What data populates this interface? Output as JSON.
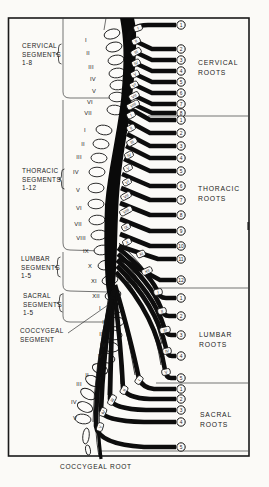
{
  "figure": {
    "left_column": {
      "cervical_segments": [
        "CERVICAL",
        "SEGMENTS",
        "1-8"
      ],
      "thoracic_segments": [
        "THORACIC",
        "SEGMENTS",
        "1-12"
      ],
      "lumbar_segments": [
        "LUMBAR",
        "SEGMENTS",
        "1-5"
      ],
      "sacral_segments": [
        "SACRAL",
        "SEGMENTS",
        "1-5"
      ],
      "coccygeal_segment": [
        "COCCYGEAL",
        "SEGMENT"
      ]
    },
    "right_column": {
      "cervical_roots": [
        "CERVICAL",
        "ROOTS"
      ],
      "thoracic_roots": [
        "THORACIC",
        "ROOTS"
      ],
      "lumbar_roots": [
        "LUMBAR",
        "ROOTS"
      ],
      "sacral_roots": [
        "SACRAL",
        "ROOTS"
      ]
    },
    "bottom_label": "COCCYGEAL ROOT",
    "vertebra_numerals": {
      "cervical": [
        "I",
        "II",
        "III",
        "IV",
        "V",
        "VI",
        "VII"
      ],
      "thoracic": [
        "I",
        "II",
        "III",
        "IV",
        "V",
        "VI",
        "VII",
        "VIII",
        "IX",
        "X",
        "XI",
        "XII"
      ],
      "lumbar": [
        "I",
        "II",
        "III",
        "IV",
        "V"
      ],
      "sacral": [
        "I",
        "II",
        "III",
        "IV",
        "V"
      ]
    },
    "root_numbers": {
      "cervical": [
        "1",
        "2",
        "3",
        "4",
        "5",
        "6",
        "7",
        "8"
      ],
      "thoracic": [
        "1",
        "2",
        "3",
        "4",
        "5",
        "6",
        "7",
        "8",
        "9",
        "10",
        "11",
        "12"
      ],
      "lumbar": [
        "1",
        "2",
        "3",
        "4",
        "5"
      ],
      "sacral": [
        "1",
        "2",
        "3",
        "4",
        "5"
      ]
    },
    "root_tags": {
      "cervical": [
        "I",
        "II",
        "III",
        "IV",
        "V",
        "VI",
        "VII",
        "VIII"
      ],
      "thoracic": [
        "I",
        "II",
        "III",
        "IV",
        "V",
        "VI",
        "VII",
        "VIII",
        "IX",
        "X",
        "XI",
        "XII"
      ],
      "lumbar": [
        "I",
        "II",
        "III",
        "IV",
        "V"
      ],
      "sacral": [
        "I",
        "II",
        "III",
        "IV",
        "V"
      ]
    },
    "colors": {
      "ink": "#0d0d0d",
      "paper": "#fbfaf7"
    }
  }
}
